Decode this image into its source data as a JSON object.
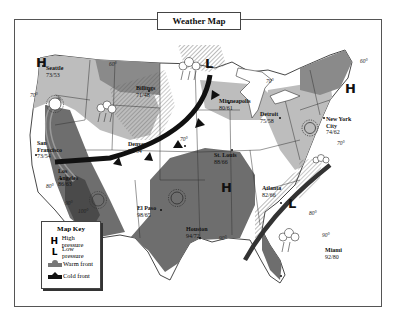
{
  "title": "Weather Map",
  "legend": {
    "title": "Map Key",
    "items": [
      {
        "symbol": "H",
        "icon": "high-pressure-icon",
        "label": "High pressure"
      },
      {
        "symbol": "L",
        "icon": "low-pressure-icon",
        "label": "Low pressure"
      },
      {
        "symbol": "warm-front",
        "icon": "warm-front-icon",
        "label": "Warm front"
      },
      {
        "symbol": "cold-front",
        "icon": "cold-front-icon",
        "label": "Cold front"
      }
    ]
  },
  "cities": [
    {
      "name": "Seattle",
      "temps": "73/53"
    },
    {
      "name": "Billings",
      "temps": "71/48"
    },
    {
      "name": "Minneapolis",
      "temps": "80/61"
    },
    {
      "name": "Detroit",
      "temps": "75/58"
    },
    {
      "name": "New York City",
      "name_line1": "New York",
      "name_line2": "City",
      "temps": "74/62"
    },
    {
      "name": "San Francisco",
      "name_line1": "San",
      "name_line2": "Francisco",
      "temps": "73/54"
    },
    {
      "name": "Los Angeles",
      "name_line1": "Los",
      "name_line2": "Angeles",
      "temps": "86/63"
    },
    {
      "name": "Denver",
      "temps": "75/54"
    },
    {
      "name": "St. Louis",
      "temps": "88/66"
    },
    {
      "name": "El Paso",
      "temps": "98/65"
    },
    {
      "name": "Houston",
      "temps": "94/72"
    },
    {
      "name": "Atlanta",
      "temps": "82/66"
    },
    {
      "name": "Miami",
      "temps": "92/80"
    }
  ],
  "isotherms": [
    "60°",
    "70°",
    "70°",
    "60°",
    "70°",
    "70°",
    "80°",
    "90°",
    "100°",
    "90°",
    "80°",
    "90°"
  ],
  "pressure_systems": [
    {
      "type": "H",
      "location": "Pacific Northwest"
    },
    {
      "type": "L",
      "location": "Northern Plains"
    },
    {
      "type": "H",
      "location": "New England"
    },
    {
      "type": "H",
      "location": "South Central"
    },
    {
      "type": "L",
      "location": "Southeast"
    }
  ],
  "colors": {
    "zone_60s": "#8a8a8a",
    "zone_70s": "#bdbdbd",
    "zone_80s": "#d9d9d9",
    "zone_90s": "#6e6e6e",
    "zone_100s": "#4a4a4a",
    "front": "#111111",
    "border": "#444444"
  }
}
